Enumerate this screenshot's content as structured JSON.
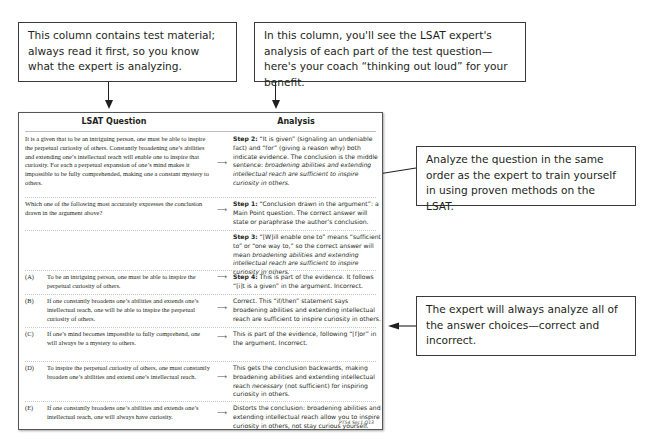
{
  "callouts": {
    "left": "This column contains test material; always read it first, so you know what the expert is analyzing.",
    "right": "In this column, you'll see the LSAT expert's analysis of each part of the test question—here's your coach “thinking out loud” for your benefit.",
    "middle": "Analyze the question in the same order as the expert to train yourself in using proven methods on the LSAT.",
    "bottom": "The expert will always analyze all of the answer choices—correct and incorrect."
  },
  "table": {
    "headers": {
      "question": "LSAT Question",
      "analysis": "Analysis"
    },
    "arrow_glyph": "⟶",
    "rows": [
      {
        "question": "It is a given that to be an intriguing person, one must be able to inspire the perpetual curiosity of others. Constantly broadening one’s abilities and extending one’s intellectual reach will enable one to inspire that curiosity. For each a perpetual expansion of one’s mind makes it impossible to be fully comprehended, making one a constant mystery to others.",
        "step": "Step 2:",
        "analysis": " “It is given” (signaling an undeniable fact) and “for” (giving a reason why) both indicate evidence. The conclusion is the middle sentence: ",
        "analysis_italic": "broadening abilities and extending intellectual reach are sufficient to inspire curiosity in others."
      },
      {
        "question": "Which one of the following most accurately expresses the conclusion drawn in the argument above?",
        "step": "Step 1:",
        "analysis": " “Conclusion drawn in the argument”: a Main Point question. The correct answer will state or paraphrase the author’s conclusion.",
        "analysis_italic": ""
      },
      {
        "question": "",
        "step": "Step 3:",
        "analysis": " “[W]ill enable one to” means “sufficient to” or “one way to,” so the correct answer will mean ",
        "analysis_italic": "broadening abilities and extending intellectual reach are sufficient to inspire curiosity in others."
      }
    ],
    "choices": [
      {
        "letter": "(A)",
        "text": "To be an intriguing person, one must be able to inspire the perpetual curiosity of others.",
        "step": "Step 4:",
        "analysis": " This is part of the evidence. It follows “[i]t is a given” in the argument. Incorrect.",
        "analysis_italic": "",
        "analysis_tail": ""
      },
      {
        "letter": "(B)",
        "text": "If one constantly broadens one’s abilities and extends one’s intellectual reach, one will be able to inspire the perpetual curiosity of others.",
        "step": "",
        "analysis": "Correct. This “if/then” statement says broadening abilities and extending intellectual reach are sufficient to inspire curiosity in others.",
        "analysis_italic": "",
        "analysis_tail": ""
      },
      {
        "letter": "(C)",
        "text": "If one’s mind becomes impossible to fully comprehend, one will always be a mystery to others.",
        "step": "",
        "analysis": "This is part of the evidence, following “[f]or” in the argument. Incorrect.",
        "analysis_italic": "",
        "analysis_tail": ""
      },
      {
        "letter": "(D)",
        "text": "To inspire the perpetual curiosity of others, one must constantly broaden one’s abilities and extend one’s intellectual reach.",
        "step": "",
        "analysis": "This gets the conclusion backwards, making broadening abilities and extending intellectual reach ",
        "analysis_italic": "necessary",
        "analysis_tail": " (not sufficient) for inspiring curiosity in others."
      },
      {
        "letter": "(E)",
        "text": "If one constantly broadens one’s abilities and extends one’s intellectual reach, one will always have curiosity.",
        "step": "",
        "analysis": "Distorts the conclusion: broadening abilities and extending intellectual reach allow you to inspire curiosity in others, not stay curious yourself.",
        "analysis_italic": "",
        "analysis_tail": ""
      }
    ],
    "credit": "PT54 Sec1 Q13"
  }
}
